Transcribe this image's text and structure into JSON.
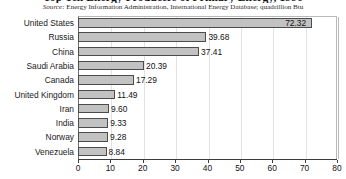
{
  "header": {
    "title": "Top Ten Energy Producers of Primary Energy, 1996",
    "source_prefix": "Source:",
    "source_text": " Energy Information Administration, International Energy Database; quadrillion Btu"
  },
  "chart_data": {
    "type": "bar",
    "orientation": "horizontal",
    "title": "Top Ten Energy Producers of Primary Energy, 1996",
    "xlabel": "",
    "ylabel": "",
    "units": "quadrillion Btu",
    "xlim": [
      0,
      80
    ],
    "xticks": [
      0,
      10,
      20,
      30,
      40,
      50,
      60,
      70,
      80
    ],
    "tick_labels": [
      "0",
      "10",
      "20",
      "30",
      "40",
      "50",
      "60",
      "70",
      "80"
    ],
    "grid": true,
    "legend": "none",
    "categories": [
      "United States",
      "Russia",
      "China",
      "Saudi Arabia",
      "Canada",
      "United Kingdom",
      "Iran",
      "India",
      "Norway",
      "Venezuela"
    ],
    "values": [
      72.32,
      39.68,
      37.41,
      20.39,
      17.29,
      11.49,
      9.6,
      9.33,
      9.28,
      8.84
    ],
    "value_labels": [
      "72.32",
      "39.68",
      "37.41",
      "20.39",
      "17.29",
      "11.49",
      "9.60",
      "9.33",
      "9.28",
      "8.84"
    ],
    "bar_color": "#c2c2c2",
    "bar_border_color": "#4c4c4c",
    "grid_color": "#e2e2e2",
    "axis_color": "#3d3d3d"
  }
}
